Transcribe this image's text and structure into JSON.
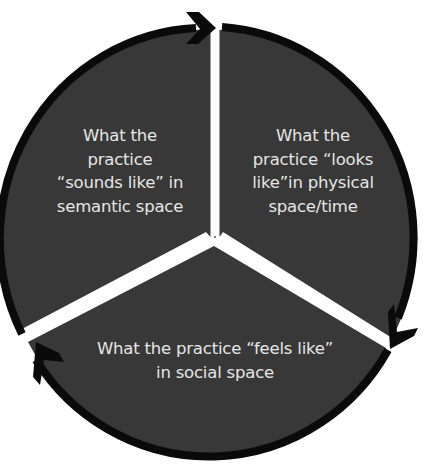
{
  "diagram": {
    "title": "",
    "colors": {
      "wedge_fill": "#383838",
      "ring": "#0a0a0a",
      "gap": "#ffffff",
      "text": "#e6e6e6",
      "background": "#ffffff"
    },
    "segments": [
      {
        "id": "semantic",
        "position": "upper-left",
        "lines": [
          "What the",
          "practice",
          "“sounds like” in",
          "semantic space"
        ]
      },
      {
        "id": "physical",
        "position": "upper-right",
        "lines": [
          "What the",
          "practice “looks",
          "like”in physical",
          "space/time"
        ]
      },
      {
        "id": "social",
        "position": "bottom",
        "lines": [
          "What the practice “feels like”",
          "in social space"
        ]
      }
    ],
    "arrows": [
      {
        "id": "arrow-top",
        "direction": "clockwise",
        "location": "top"
      },
      {
        "id": "arrow-right",
        "direction": "clockwise",
        "location": "lower-right"
      },
      {
        "id": "arrow-left",
        "direction": "clockwise",
        "location": "lower-left"
      }
    ]
  }
}
